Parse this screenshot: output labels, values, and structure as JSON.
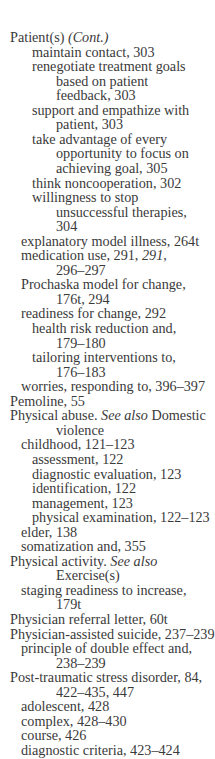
{
  "index": {
    "lines": [
      {
        "indent": 10,
        "parts": [
          {
            "t": "Patient(s) "
          },
          {
            "t": "(Cont.)",
            "i": true
          }
        ]
      },
      {
        "indent": 32,
        "parts": [
          {
            "t": "maintain contact, 303"
          }
        ]
      },
      {
        "indent": 32,
        "parts": [
          {
            "t": "renegotiate treatment goals"
          }
        ]
      },
      {
        "indent": 56,
        "parts": [
          {
            "t": "based on patient"
          }
        ]
      },
      {
        "indent": 56,
        "parts": [
          {
            "t": "feedback, 303"
          }
        ]
      },
      {
        "indent": 32,
        "parts": [
          {
            "t": "support and empathize with"
          }
        ]
      },
      {
        "indent": 56,
        "parts": [
          {
            "t": "patient, 303"
          }
        ]
      },
      {
        "indent": 32,
        "parts": [
          {
            "t": "take advantage of every"
          }
        ]
      },
      {
        "indent": 56,
        "parts": [
          {
            "t": "opportunity to focus on"
          }
        ]
      },
      {
        "indent": 56,
        "parts": [
          {
            "t": "achieving goal, 305"
          }
        ]
      },
      {
        "indent": 32,
        "parts": [
          {
            "t": "think noncooperation, 302"
          }
        ]
      },
      {
        "indent": 32,
        "parts": [
          {
            "t": "willingness to stop"
          }
        ]
      },
      {
        "indent": 56,
        "parts": [
          {
            "t": "unsuccessful therapies,"
          }
        ]
      },
      {
        "indent": 56,
        "parts": [
          {
            "t": "304"
          }
        ]
      },
      {
        "indent": 21,
        "parts": [
          {
            "t": "explanatory model illness, 264t"
          }
        ]
      },
      {
        "indent": 21,
        "parts": [
          {
            "t": "medication use, 291, "
          },
          {
            "t": "291,",
            "i": true
          }
        ]
      },
      {
        "indent": 56,
        "parts": [
          {
            "t": "296–297"
          }
        ]
      },
      {
        "indent": 21,
        "parts": [
          {
            "t": "Prochaska model for change,"
          }
        ]
      },
      {
        "indent": 56,
        "parts": [
          {
            "t": "176t, 294"
          }
        ]
      },
      {
        "indent": 21,
        "parts": [
          {
            "t": "readiness for change, 292"
          }
        ]
      },
      {
        "indent": 32,
        "parts": [
          {
            "t": "health risk reduction and,"
          }
        ]
      },
      {
        "indent": 56,
        "parts": [
          {
            "t": "179–180"
          }
        ]
      },
      {
        "indent": 32,
        "parts": [
          {
            "t": "tailoring interventions to,"
          }
        ]
      },
      {
        "indent": 56,
        "parts": [
          {
            "t": "176–183"
          }
        ]
      },
      {
        "indent": 21,
        "parts": [
          {
            "t": "worries, responding to, 396–397"
          }
        ]
      },
      {
        "indent": 10,
        "parts": [
          {
            "t": "Pemoline, 55"
          }
        ]
      },
      {
        "indent": 10,
        "parts": [
          {
            "t": "Physical abuse. "
          },
          {
            "t": "See also",
            "i": true
          },
          {
            "t": " Domestic"
          }
        ]
      },
      {
        "indent": 56,
        "parts": [
          {
            "t": "violence"
          }
        ]
      },
      {
        "indent": 21,
        "parts": [
          {
            "t": "childhood, 121–123"
          }
        ]
      },
      {
        "indent": 32,
        "parts": [
          {
            "t": "assessment, 122"
          }
        ]
      },
      {
        "indent": 32,
        "parts": [
          {
            "t": "diagnostic evaluation, 123"
          }
        ]
      },
      {
        "indent": 32,
        "parts": [
          {
            "t": "identification, 122"
          }
        ]
      },
      {
        "indent": 32,
        "parts": [
          {
            "t": "management, 123"
          }
        ]
      },
      {
        "indent": 32,
        "parts": [
          {
            "t": "physical examination, 122–123"
          }
        ]
      },
      {
        "indent": 21,
        "parts": [
          {
            "t": "elder, 138"
          }
        ]
      },
      {
        "indent": 21,
        "parts": [
          {
            "t": "somatization and, 355"
          }
        ]
      },
      {
        "indent": 10,
        "parts": [
          {
            "t": "Physical activity. "
          },
          {
            "t": "See also",
            "i": true
          }
        ]
      },
      {
        "indent": 56,
        "parts": [
          {
            "t": "Exercise(s)"
          }
        ]
      },
      {
        "indent": 21,
        "parts": [
          {
            "t": "staging readiness to increase,"
          }
        ]
      },
      {
        "indent": 56,
        "parts": [
          {
            "t": "179t"
          }
        ]
      },
      {
        "indent": 10,
        "parts": [
          {
            "t": "Physician referral letter, 60t"
          }
        ]
      },
      {
        "indent": 10,
        "parts": [
          {
            "t": "Physician-assisted suicide, 237–239"
          }
        ]
      },
      {
        "indent": 21,
        "parts": [
          {
            "t": "principle of double effect and,"
          }
        ]
      },
      {
        "indent": 56,
        "parts": [
          {
            "t": "238–239"
          }
        ]
      },
      {
        "indent": 10,
        "parts": [
          {
            "t": "Post-traumatic stress disorder, 84,"
          }
        ]
      },
      {
        "indent": 56,
        "parts": [
          {
            "t": "422–435, 447"
          }
        ]
      },
      {
        "indent": 21,
        "parts": [
          {
            "t": "adolescent, 428"
          }
        ]
      },
      {
        "indent": 21,
        "parts": [
          {
            "t": "complex, 428–430"
          }
        ]
      },
      {
        "indent": 21,
        "parts": [
          {
            "t": "course, 426"
          }
        ]
      },
      {
        "indent": 21,
        "parts": [
          {
            "t": "diagnostic criteria, 423–424"
          }
        ]
      }
    ]
  }
}
